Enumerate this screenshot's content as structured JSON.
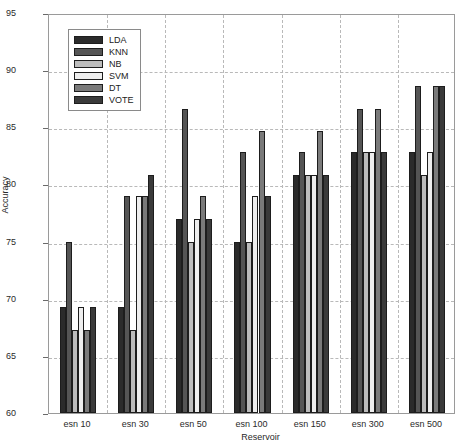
{
  "chart_data": {
    "type": "bar",
    "title": "",
    "xlabel": "Reservoir",
    "ylabel": "Accuracy",
    "ylim": [
      60,
      95
    ],
    "yticks": [
      60,
      65,
      70,
      75,
      80,
      85,
      90,
      95
    ],
    "grid": true,
    "legend_position": "upper-left",
    "categories": [
      "esn 10",
      "esn 30",
      "esn 50",
      "esn 100",
      "esn 150",
      "esn 300",
      "esn 500"
    ],
    "series": [
      {
        "name": "LDA",
        "color": "#2b2b2b",
        "values": [
          69.3,
          69.3,
          77.0,
          75.0,
          80.8,
          82.8,
          82.8
        ]
      },
      {
        "name": "KNN",
        "color": "#555555",
        "values": [
          75.0,
          79.0,
          86.6,
          82.8,
          82.8,
          86.6,
          88.6
        ]
      },
      {
        "name": "NB",
        "color": "#bcbcbc",
        "values": [
          67.3,
          67.3,
          75.0,
          75.0,
          80.8,
          82.8,
          80.8
        ]
      },
      {
        "name": "SVM",
        "color": "#eeeeee",
        "values": [
          69.3,
          79.0,
          77.0,
          79.0,
          80.8,
          82.8,
          82.8
        ]
      },
      {
        "name": "DT",
        "color": "#7a7a7a",
        "values": [
          67.3,
          79.0,
          79.0,
          84.7,
          84.7,
          86.6,
          88.6
        ]
      },
      {
        "name": "VOTE",
        "color": "#3a3a3a",
        "values": [
          69.3,
          80.8,
          77.0,
          79.0,
          80.8,
          82.8,
          88.6
        ]
      }
    ]
  },
  "axes": {
    "y_tick_labels": [
      "95",
      "90",
      "85",
      "80",
      "75",
      "70",
      "65",
      "60"
    ],
    "x_tick_labels": [
      "esn 10",
      "esn 30",
      "esn 50",
      "esn 100",
      "esn 150",
      "esn 300",
      "esn 500"
    ],
    "y_axis_title": "Accuracy",
    "x_axis_title": "Reservoir"
  },
  "legend": {
    "items": [
      {
        "label": "LDA"
      },
      {
        "label": "KNN"
      },
      {
        "label": "NB"
      },
      {
        "label": "SVM"
      },
      {
        "label": "DT"
      },
      {
        "label": "VOTE"
      }
    ]
  }
}
